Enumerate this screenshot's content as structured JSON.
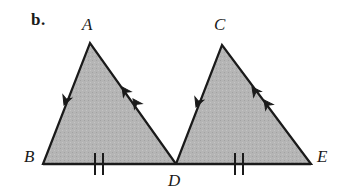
{
  "figure": {
    "part_label": "b.",
    "caption": "Two shaded triangles ABD and CDE sharing vertex D on a common baseline BE, marked with congruence arrowheads and tick marks",
    "background_color": "#ffffff",
    "fill_color": "#b5b5b5",
    "stroke_color": "#1a1a1a",
    "label_color": "#1a1a1a"
  },
  "vertices": {
    "A": {
      "label": "A",
      "x": 90,
      "y": 43,
      "label_x": 82,
      "label_y": 16
    },
    "B": {
      "label": "B",
      "x": 43,
      "y": 164,
      "label_x": 24,
      "label_y": 148
    },
    "C": {
      "label": "C",
      "x": 222,
      "y": 45,
      "label_x": 214,
      "label_y": 16
    },
    "D": {
      "label": "D",
      "x": 176,
      "y": 164,
      "label_x": 168,
      "label_y": 172
    },
    "E": {
      "label": "E",
      "x": 311,
      "y": 164,
      "label_x": 317,
      "label_y": 148
    }
  },
  "shapes": [
    {
      "name": "triangle-abd",
      "points": "43,164 90,43 176,164",
      "fill": "#b5b5b5",
      "stroke": "#1a1a1a",
      "stroke_width": 2.2
    },
    {
      "name": "triangle-cde",
      "points": "176,164 222,45 311,164",
      "fill": "#b5b5b5",
      "stroke": "#1a1a1a",
      "stroke_width": 2.2
    }
  ],
  "baseline": {
    "name": "baseline-be",
    "x1": 43,
    "y1": 164,
    "x2": 311,
    "y2": 164,
    "stroke": "#1a1a1a",
    "stroke_width": 2.4
  },
  "marks": {
    "arrowheads": [
      {
        "name": "arrowhead-ba-1",
        "segment": "BA",
        "count": 1,
        "x": 64,
        "y": 105,
        "angle": -68.7
      },
      {
        "name": "arrowhead-ad-1",
        "segment": "AD",
        "count": 2,
        "x": 122,
        "y": 87,
        "angle": 54.6
      },
      {
        "name": "arrowhead-ad-2",
        "segment": "AD",
        "count": 2,
        "x": 133,
        "y": 99,
        "angle": 54.6
      },
      {
        "name": "arrowhead-dc-1",
        "segment": "DC",
        "count": 1,
        "x": 196,
        "y": 107,
        "angle": -68.9
      },
      {
        "name": "arrowhead-ce-1",
        "segment": "CE",
        "count": 2,
        "x": 252,
        "y": 87,
        "angle": 53.2
      },
      {
        "name": "arrowhead-ce-2",
        "segment": "CE",
        "count": 2,
        "x": 264,
        "y": 100,
        "angle": 53.2
      }
    ],
    "ticks": [
      {
        "name": "tick-bd-1",
        "segment": "BD",
        "x": 95,
        "y": 164
      },
      {
        "name": "tick-bd-2",
        "segment": "BD",
        "x": 103,
        "y": 164
      },
      {
        "name": "tick-de-1",
        "segment": "DE",
        "x": 235,
        "y": 164
      },
      {
        "name": "tick-de-2",
        "segment": "DE",
        "x": 243,
        "y": 164
      }
    ],
    "tick_half_height": 11,
    "tick_stroke": "#1a1a1a",
    "tick_stroke_width": 2.0,
    "arrow_size": 9
  }
}
